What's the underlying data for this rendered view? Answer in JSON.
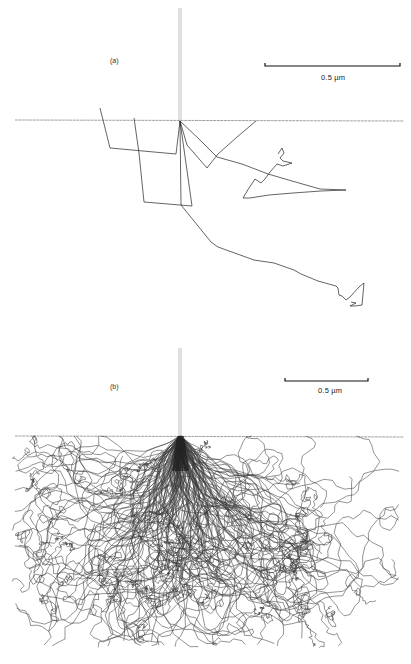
{
  "figure": {
    "panels": [
      {
        "id": "a",
        "label": "(a)",
        "scale_bar": {
          "text": "0.5 µm",
          "x1": 265,
          "x2": 400,
          "y": 66,
          "text_x": 321,
          "text_y": 73
        },
        "surface_y": 120,
        "beam": {
          "x": 180,
          "y_top": 8,
          "y_bottom": 121
        },
        "label_pos": {
          "x": 110,
          "y": 57
        },
        "trajectories": [
          "M100,108 L110,148 L176,154 L180,121",
          "M134,118 L139,153 L144,202 L192,206 L180,121",
          "M180,121 L181,205 L211,242 L218,247 L254,260 L274,263 L294,270 L301,274 L318,281 L336,286 L338,288 L339,295 L342,296 L346,300 L350,297 L359,287 L364,283 L362,305 L355,306 L350,306 L356,303 L351,302",
          "M180,121 L187,145 L207,168 L218,154 L237,137 L256,121",
          "M180,121 L200,140 L217,157 L242,164 L268,174 L299,183 L320,189 L346,190 L321,191 L293,193 L269,195 L250,198 L243,198 L249,188 L255,179 L261,183 L265,179 L270,172 L277,164 L283,166 L292,163 L283,161 L280,158 L284,153 L282,148 L278,154"
        ]
      },
      {
        "id": "b",
        "label": "(b)",
        "scale_bar": {
          "text": "0.5 µm",
          "x1": 285,
          "x2": 368,
          "y": 51,
          "text_x": 318,
          "text_y": 56
        },
        "surface_y": 106,
        "beam": {
          "x": 180,
          "y_top": 18,
          "y_bottom": 106
        },
        "label_pos": {
          "x": 110,
          "y": 53
        },
        "sim": {
          "count": 150,
          "seed": 1337,
          "steps": 90
        }
      }
    ]
  }
}
